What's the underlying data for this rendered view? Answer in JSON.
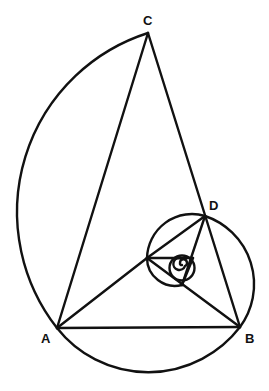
{
  "figure": {
    "type": "golden-triangle-spiral",
    "stroke_color": "#111111",
    "background": "#ffffff"
  },
  "labels": {
    "C": "C",
    "D": "D",
    "A": "A",
    "B": "B"
  },
  "points": {
    "A": [
      57,
      328
    ],
    "B": [
      240,
      327
    ],
    "C": [
      148,
      33
    ],
    "D": [
      205,
      216
    ],
    "E": [
      147,
      258
    ],
    "F": [
      182,
      285
    ],
    "G": [
      193,
      258
    ]
  }
}
